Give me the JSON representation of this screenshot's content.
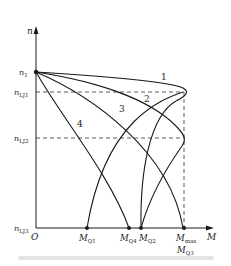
{
  "diagram": {
    "axes": {
      "y_label": "n",
      "x_label": "M",
      "origin_label": "O",
      "y_ticks": [
        {
          "main": "n",
          "sub": "1"
        },
        {
          "main": "n",
          "sub": "LJ1"
        },
        {
          "main": "n",
          "sub": "LJ2"
        },
        {
          "main": "n",
          "sub": "LJ3"
        }
      ],
      "x_ticks": [
        {
          "main": "M",
          "sub": "Q1"
        },
        {
          "main": "M",
          "sub": "Q4"
        },
        {
          "main": "M",
          "sub": "Q2"
        },
        {
          "main": "M",
          "sub": "max"
        },
        {
          "main": "M",
          "sub": "Q3"
        }
      ]
    },
    "curve_labels": [
      "1",
      "2",
      "3",
      "4"
    ],
    "colors": {
      "line": "#1a1a1a",
      "dash": "#333333"
    },
    "caption": ""
  }
}
